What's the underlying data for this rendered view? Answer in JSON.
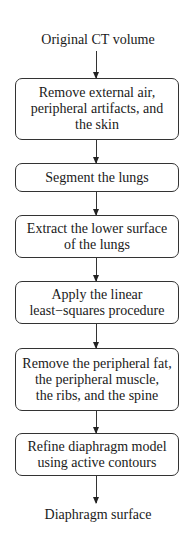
{
  "diagram": {
    "type": "flowchart",
    "start": "Original CT volume",
    "steps": [
      "Remove external air,\nperipheral artifacts, and\nthe skin",
      "Segment the lungs",
      "Extract the lower surface\nof the lungs",
      "Apply the linear\nleast−squares procedure",
      "Remove the peripheral fat,\nthe peripheral muscle,\nthe ribs, and the spine",
      "Refine diaphragm model\nusing active contours"
    ],
    "end": "Diaphragm surface"
  }
}
